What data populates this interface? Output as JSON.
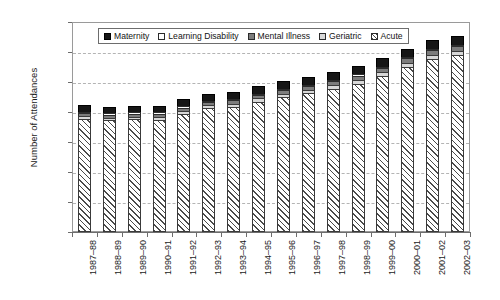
{
  "chart_data": {
    "type": "bar",
    "subtype": "stacked-vertical",
    "title": "",
    "xlabel": "",
    "ylabel": "Number of Attendances",
    "ylim": [
      0,
      14000000
    ],
    "ytick_step": 2000000,
    "ytick_labels": [
      "14 000 000",
      "12 000 000",
      "10 000 000",
      "8 000 000",
      "6 000 000",
      "4 000 000",
      "2 000 000",
      "0"
    ],
    "ytick_values": [
      14000000,
      12000000,
      10000000,
      8000000,
      6000000,
      4000000,
      2000000,
      0
    ],
    "grid": true,
    "grid_axis": "y",
    "legend_position": "top-inside",
    "categories": [
      "1987–88",
      "1988–89",
      "1989–90",
      "1990–91",
      "1991–92",
      "1992–93",
      "1993–94",
      "1994–95",
      "1995–96",
      "1996–97",
      "1997–98",
      "1998–99",
      "1999–00",
      "2000–01",
      "2001–02",
      "2002–03"
    ],
    "series": [
      {
        "name": "Acute",
        "color": "#ffffff",
        "pattern": "diagonal-hatch",
        "values": [
          7550000,
          7450000,
          7520000,
          7500000,
          7900000,
          8250000,
          8350000,
          8700000,
          9000000,
          9250000,
          9550000,
          9900000,
          10400000,
          11000000,
          11550000,
          11800000
        ]
      },
      {
        "name": "Geriatric",
        "color": "#d8d8d8",
        "pattern": "solid",
        "values": [
          180000,
          175000,
          175000,
          180000,
          185000,
          190000,
          200000,
          210000,
          220000,
          230000,
          240000,
          250000,
          260000,
          270000,
          280000,
          290000
        ]
      },
      {
        "name": "Mental Illness",
        "color": "#7c7c7c",
        "pattern": "solid",
        "values": [
          200000,
          200000,
          205000,
          210000,
          215000,
          220000,
          230000,
          240000,
          250000,
          260000,
          270000,
          280000,
          290000,
          300000,
          310000,
          320000
        ]
      },
      {
        "name": "Learning Disability",
        "color": "#ffffff",
        "pattern": "solid",
        "values": [
          30000,
          30000,
          30000,
          30000,
          30000,
          30000,
          30000,
          30000,
          30000,
          30000,
          30000,
          30000,
          30000,
          30000,
          30000,
          30000
        ]
      },
      {
        "name": "Maternity",
        "color": "#161616",
        "pattern": "solid",
        "values": [
          440000,
          445000,
          440000,
          440000,
          470000,
          490000,
          500000,
          510000,
          520000,
          530000,
          540000,
          550000,
          560000,
          570000,
          580000,
          590000
        ]
      }
    ],
    "totals": [
      8400000,
      8300000,
      8370000,
      8360000,
      8800000,
      9180000,
      9310000,
      9690000,
      10020000,
      10300000,
      10630000,
      11010000,
      11540000,
      12170000,
      12750000,
      13030000
    ]
  },
  "legend": {
    "items": [
      {
        "label": "Maternity",
        "swatch": "maternity-swatch"
      },
      {
        "label": "Learning Disability",
        "swatch": "learning-disability-swatch"
      },
      {
        "label": "Mental Illness",
        "swatch": "mental-illness-swatch"
      },
      {
        "label": "Geriatric",
        "swatch": "geriatric-swatch"
      },
      {
        "label": "Acute",
        "swatch": "acute-swatch"
      }
    ]
  }
}
